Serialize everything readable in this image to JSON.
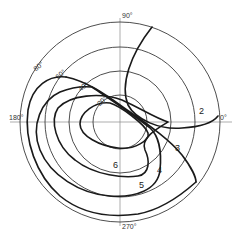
{
  "diagram": {
    "type": "polar-contour",
    "azimuth_labels": {
      "north": "90°",
      "east": "0°",
      "west": "180°",
      "south": "270°"
    },
    "ring_labels": {
      "r20": "20°",
      "r40": "40°",
      "r60": "60°",
      "r80": "80°"
    },
    "contours": [
      {
        "id": "2",
        "label": "2"
      },
      {
        "id": "3",
        "label": "3"
      },
      {
        "id": "4",
        "label": "4"
      },
      {
        "id": "5",
        "label": "5"
      },
      {
        "id": "6",
        "label": "6"
      }
    ],
    "stroke_color": "#1a1a1a",
    "background": "#ffffff"
  }
}
